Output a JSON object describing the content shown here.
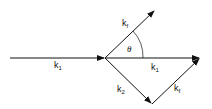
{
  "diagram": {
    "type": "vector-diagram",
    "colors": {
      "line": "#111111",
      "background": "#ffffff"
    },
    "vectors": [
      {
        "id": "k1-incoming",
        "base": "k",
        "sub": "1"
      },
      {
        "id": "kf",
        "base": "k",
        "sub": "f"
      },
      {
        "id": "k1-horizontal",
        "base": "k",
        "sub": "1"
      },
      {
        "id": "k2",
        "base": "k",
        "sub": "2"
      },
      {
        "id": "kl",
        "base": "k",
        "sub": "ℓ"
      }
    ],
    "angle_label": "θ"
  }
}
